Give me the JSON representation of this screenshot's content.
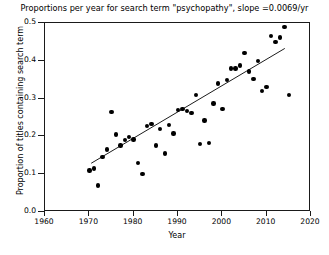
{
  "chart_data": {
    "type": "scatter",
    "title": "Proportions per year for search term \"psychopathy\", slope =0.0069/yr",
    "xlabel": "Year",
    "ylabel": "Proportion of titles containing search term",
    "xlim": [
      1960,
      2020
    ],
    "ylim": [
      0.0,
      0.5
    ],
    "xticks": [
      1960,
      1970,
      1980,
      1990,
      2000,
      2010,
      2020
    ],
    "xtick_labels": [
      "1960",
      "1970",
      "1980",
      "1990",
      "2000",
      "2010",
      "2020"
    ],
    "yticks": [
      0.0,
      0.1,
      0.2,
      0.3,
      0.4,
      0.5
    ],
    "ytick_labels": [
      "0.0",
      "0.1",
      "0.2",
      "0.3",
      "0.4",
      "0.5"
    ],
    "grid": false,
    "legend": "none",
    "marker_color": "#000000",
    "trendline_color": "#000000",
    "slope_per_year": 0.0069,
    "trendline": {
      "x": [
        1970.5,
        2014.5
      ],
      "y": [
        0.125,
        0.432
      ]
    },
    "x": [
      1970,
      1971,
      1972,
      1973,
      1974,
      1975,
      1976,
      1977,
      1978,
      1979,
      1980,
      1981,
      1982,
      1983,
      1984,
      1985,
      1986,
      1987,
      1988,
      1989,
      1990,
      1991,
      1992,
      1993,
      1994,
      1995,
      1996,
      1997,
      1998,
      1999,
      2000,
      2001,
      2002,
      2003,
      2004,
      2005,
      2006,
      2007,
      2008,
      2009,
      2010,
      2011,
      2012,
      2013,
      2014,
      2015
    ],
    "y": [
      0.11,
      0.115,
      0.07,
      0.145,
      0.165,
      0.265,
      0.205,
      0.176,
      0.19,
      0.198,
      0.192,
      0.13,
      0.1,
      0.228,
      0.233,
      0.176,
      0.22,
      0.155,
      0.23,
      0.208,
      0.27,
      0.272,
      0.268,
      0.262,
      0.31,
      0.18,
      0.242,
      0.183,
      0.287,
      0.34,
      0.272,
      0.35,
      0.38,
      0.38,
      0.388,
      0.42,
      0.372,
      0.352,
      0.4,
      0.32,
      0.33,
      0.465,
      0.45,
      0.462,
      0.49,
      0.31
    ]
  }
}
